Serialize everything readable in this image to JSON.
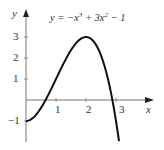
{
  "chart_data": {
    "type": "line",
    "equation": {
      "prefix": "y = −x",
      "exp1": "3",
      "mid": " + 3x",
      "exp2": "2",
      "suffix": " − 1"
    },
    "xlabel": "x",
    "ylabel": "y",
    "xlim": [
      0,
      3.1
    ],
    "ylim": [
      -1.9,
      3.6
    ],
    "x_ticks": [
      "1",
      "2",
      "3"
    ],
    "y_ticks": [
      "−1",
      "1",
      "2",
      "3"
    ],
    "grid": false,
    "series": [
      {
        "name": "y = -x^3 + 3x^2 - 1",
        "x": [
          0,
          0.25,
          0.5,
          0.75,
          1,
          1.25,
          1.5,
          1.75,
          2,
          2.25,
          2.5,
          2.75,
          3,
          3.1
        ],
        "y": [
          -1,
          -0.83,
          -0.38,
          0.27,
          1,
          1.73,
          2.38,
          2.83,
          3,
          2.8,
          2.13,
          0.89,
          -1,
          -1.96
        ]
      }
    ]
  },
  "labels": {
    "x_axis": "x",
    "y_axis": "y",
    "t1": "1",
    "t2": "2",
    "t3": "3",
    "tm1": "−1"
  }
}
